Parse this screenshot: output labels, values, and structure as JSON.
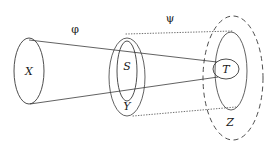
{
  "figure": {
    "type": "commutative-cone-diagram",
    "background_color": "#ffffff",
    "stroke_color": "#3a3a3a",
    "label_color": "#1a1a1a"
  },
  "labels": {
    "source_set": "X",
    "middle_inner_set": "S",
    "middle_outer_set": "Y",
    "target_inner_set": "T",
    "target_outer_set": "Z",
    "map_left": "φ",
    "map_right": "ψ"
  },
  "shapes": {
    "x_ellipse": {
      "cx": 29,
      "cy": 71,
      "rx": 15,
      "ry": 33,
      "style": "solid"
    },
    "s_ellipse": {
      "cx": 127,
      "cy": 71,
      "rx": 10,
      "ry": 30,
      "style": "solid"
    },
    "y_ellipse": {
      "cx": 127,
      "cy": 77,
      "rx": 18,
      "ry": 39,
      "style": "solid"
    },
    "t_ellipse": {
      "cx": 226,
      "cy": 69,
      "rx": 13,
      "ry": 10,
      "style": "solid"
    },
    "z_inner_ellipse": {
      "cx": 231,
      "cy": 71,
      "rx": 16,
      "ry": 39,
      "style": "solid"
    },
    "z_outer_ellipse": {
      "cx": 233,
      "cy": 78,
      "rx": 30,
      "ry": 62,
      "style": "dashed"
    }
  },
  "connectors": {
    "phi_cone_top": {
      "from": [
        29,
        40
      ],
      "to": [
        217,
        62
      ],
      "style": "solid"
    },
    "phi_cone_bottom": {
      "from": [
        30,
        104
      ],
      "to": [
        218,
        77
      ],
      "style": "solid"
    },
    "psi_tube_top": {
      "from": [
        126,
        34
      ],
      "to": [
        233,
        31
      ],
      "style": "dotted"
    },
    "psi_tube_bottom": {
      "from": [
        133,
        116
      ],
      "to": [
        236,
        107
      ],
      "style": "dotted"
    }
  },
  "label_positions": {
    "X": [
      29,
      75
    ],
    "S": [
      127,
      70
    ],
    "Y": [
      127,
      110
    ],
    "T": [
      226,
      72
    ],
    "Z": [
      230,
      126
    ],
    "phi": [
      75,
      32
    ],
    "psi": [
      170,
      21
    ]
  }
}
